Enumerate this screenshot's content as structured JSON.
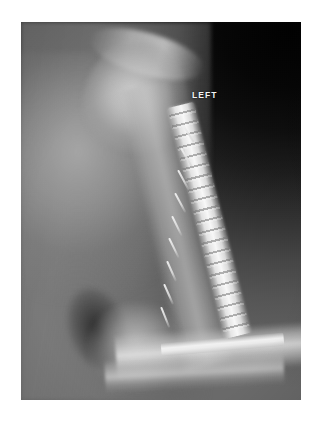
{
  "page": {
    "background_color": "#ffffff",
    "width": 327,
    "height": 421
  },
  "header": {
    "left_text": "",
    "right_text": ""
  },
  "radiograph": {
    "modality": "X-ray",
    "side_marker": "LEFT",
    "frame": {
      "x": 21,
      "y": 22,
      "width": 280,
      "height": 378,
      "background_color": "#0a0a0a"
    },
    "palette": {
      "film_black": "#000000",
      "film_dark": "#1c1c1c",
      "soft_tissue_gray": "#6f6f6f",
      "bone_gray": "#b4b4b4",
      "bone_bright": "#d8d8d8",
      "implant_white": "#fafafa",
      "marker_text": "#f4f4f4"
    },
    "anatomy": [
      {
        "name": "acromion-clavicle",
        "label": "Acromion / clavicle"
      },
      {
        "name": "humeral-head",
        "label": "Humeral head"
      },
      {
        "name": "scapula",
        "label": "Scapula / chest wall"
      },
      {
        "name": "humeral-shaft",
        "label": "Humeral shaft"
      },
      {
        "name": "elbow",
        "label": "Distal humerus / elbow"
      },
      {
        "name": "forearm",
        "label": "Radius and ulna"
      }
    ],
    "hardware": {
      "name": "fixation-plate",
      "label": "Orthopedic fixation plate with screws",
      "screw_count": 9
    }
  }
}
